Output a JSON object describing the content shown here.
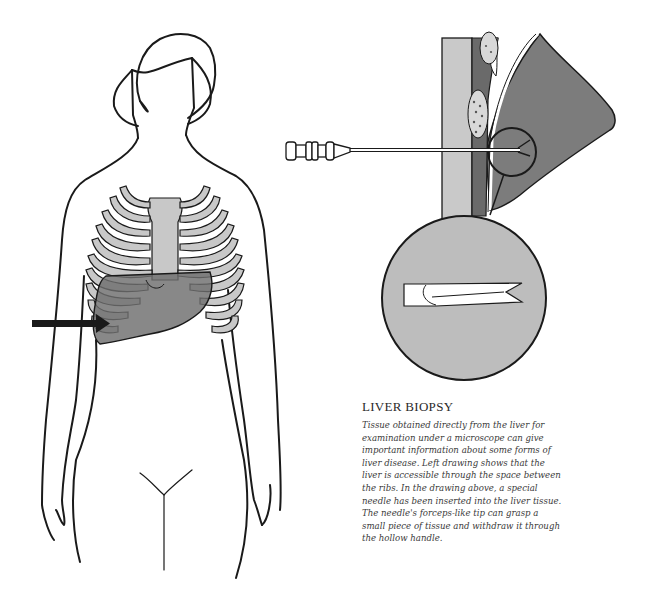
{
  "caption": {
    "title": "LIVER BIOPSY",
    "body": "Tissue obtained directly from the liver for examination under a microscope can give important information about some forms of liver disease. Left drawing shows that the liver is accessible through the space between the ribs. In the drawing above, a special needle has been inserted into the liver tissue. The needle's forceps-like tip can grasp a small piece of tissue and withdraw it through the hollow handle."
  },
  "figures": {
    "left": "Female torso outline showing rib cage with liver highlighted and arrow pointing to liver between ribs",
    "right_top": "Cross-section: biopsy needle inserted through chest wall between ribs into liver",
    "right_detail": "Magnified view of needle's forceps-like tip"
  },
  "colors": {
    "outline": "#1a1a1a",
    "rib_fill": "#c8c8c8",
    "liver_fill": "#7a7a7a",
    "tissue_dark": "#6e6e6e",
    "tissue_mid": "#8c8c8c",
    "magnifier_fill": "#bdbdbd",
    "background": "#ffffff"
  }
}
